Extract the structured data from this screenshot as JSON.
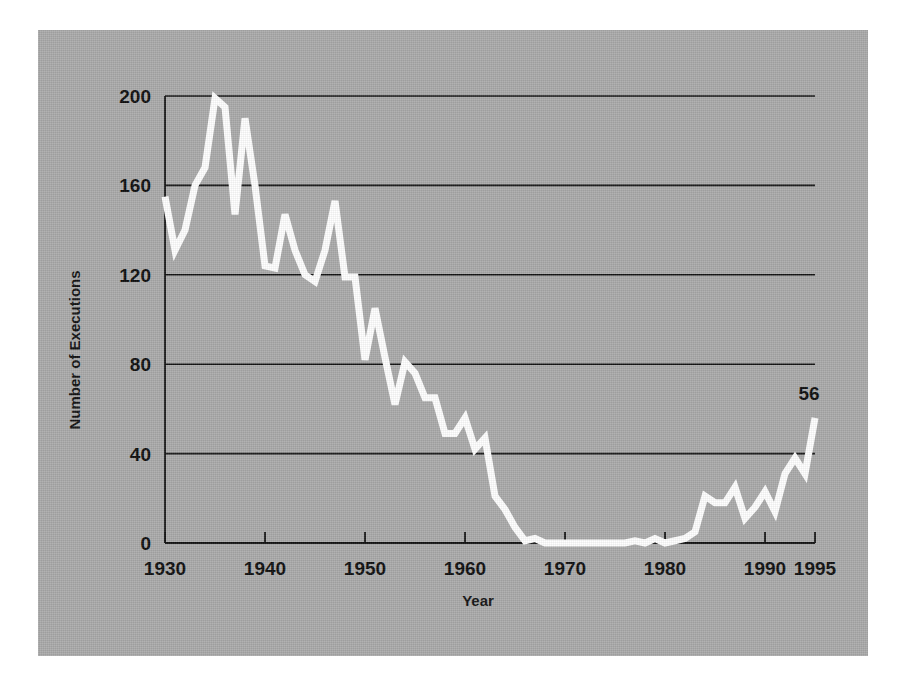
{
  "figure": {
    "background_color": "#aaaaaa",
    "page_color": "#ffffff",
    "line_color": "#ffffff",
    "axis_color": "#111111"
  },
  "chart_data": {
    "type": "line",
    "title": "",
    "xlabel": "Year",
    "ylabel": "Number of Executions",
    "xlim": [
      1930,
      1995
    ],
    "ylim": [
      0,
      200
    ],
    "grid": true,
    "legend": "none",
    "xticks": [
      "1930",
      "1940",
      "1950",
      "1960",
      "1970",
      "1980",
      "1990",
      "1995"
    ],
    "xtick_values": [
      1930,
      1940,
      1950,
      1960,
      1970,
      1980,
      1990,
      1995
    ],
    "yticks": [
      "0",
      "40",
      "80",
      "120",
      "160",
      "200"
    ],
    "ytick_values": [
      0,
      40,
      80,
      120,
      160,
      200
    ],
    "annotations": [
      {
        "label": "56",
        "x": 1995,
        "y": 56
      }
    ],
    "series": [
      {
        "name": "Number of Executions",
        "color": "#ffffff",
        "x": [
          1930,
          1931,
          1932,
          1933,
          1934,
          1935,
          1936,
          1937,
          1938,
          1939,
          1940,
          1941,
          1942,
          1943,
          1944,
          1945,
          1946,
          1947,
          1948,
          1949,
          1950,
          1951,
          1952,
          1953,
          1954,
          1955,
          1956,
          1957,
          1958,
          1959,
          1960,
          1961,
          1962,
          1963,
          1964,
          1965,
          1966,
          1967,
          1968,
          1969,
          1970,
          1971,
          1972,
          1973,
          1974,
          1975,
          1976,
          1977,
          1978,
          1979,
          1980,
          1981,
          1982,
          1983,
          1984,
          1985,
          1986,
          1987,
          1988,
          1989,
          1990,
          1991,
          1992,
          1993,
          1994,
          1995
        ],
        "values": [
          155,
          131,
          140,
          160,
          168,
          199,
          195,
          147,
          190,
          160,
          124,
          123,
          147,
          131,
          120,
          117,
          131,
          153,
          119,
          119,
          82,
          105,
          83,
          62,
          81,
          76,
          65,
          65,
          49,
          49,
          56,
          42,
          47,
          21,
          15,
          7,
          1,
          2,
          0,
          0,
          0,
          0,
          0,
          0,
          0,
          0,
          0,
          1,
          0,
          2,
          0,
          1,
          2,
          5,
          21,
          18,
          18,
          25,
          11,
          16,
          23,
          14,
          31,
          38,
          31,
          56
        ]
      }
    ]
  }
}
